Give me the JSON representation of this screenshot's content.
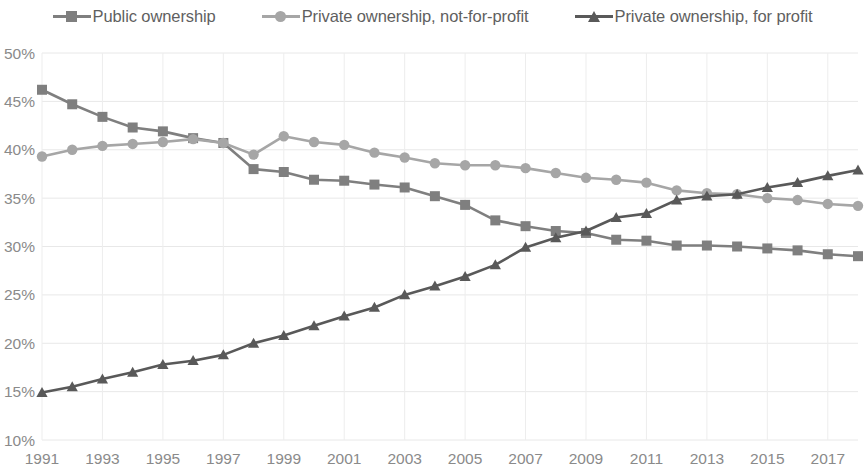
{
  "legend": {
    "position": "top-center",
    "items": [
      {
        "label": "Public ownership",
        "marker": "square-marker-icon",
        "color": "#7f7f7f"
      },
      {
        "label": "Private ownership, not-for-profit",
        "marker": "circle-marker-icon",
        "color": "#a6a6a6"
      },
      {
        "label": "Private ownership, for profit",
        "marker": "triangle-marker-icon",
        "color": "#595959"
      }
    ]
  },
  "axes": {
    "y_ticks": [
      "10%",
      "15%",
      "20%",
      "25%",
      "30%",
      "35%",
      "40%",
      "45%",
      "50%"
    ],
    "x_ticks": [
      "1991",
      "1993",
      "1995",
      "1997",
      "1999",
      "2001",
      "2003",
      "2005",
      "2007",
      "2009",
      "2011",
      "2013",
      "2015",
      "2017"
    ]
  },
  "chart_data": {
    "type": "line",
    "title": "",
    "subtitle": "",
    "xlabel": "",
    "ylabel": "",
    "xlim": [
      1991,
      2018
    ],
    "ylim": [
      10,
      50
    ],
    "y_tick_step": 5,
    "x_tick_step": 2,
    "grid": true,
    "value_suffix": "%",
    "legend_position": "top-center",
    "x": [
      1991,
      1992,
      1993,
      1994,
      1995,
      1996,
      1997,
      1998,
      1999,
      2000,
      2001,
      2002,
      2003,
      2004,
      2005,
      2006,
      2007,
      2008,
      2009,
      2010,
      2011,
      2012,
      2013,
      2014,
      2015,
      2016,
      2017,
      2018
    ],
    "series": [
      {
        "name": "Public ownership",
        "color": "#7f7f7f",
        "marker": "square",
        "values": [
          46.2,
          44.7,
          43.4,
          42.3,
          41.9,
          41.2,
          40.7,
          38.0,
          37.7,
          36.9,
          36.8,
          36.4,
          36.1,
          35.2,
          34.3,
          32.7,
          32.1,
          31.6,
          31.4,
          30.7,
          30.6,
          30.1,
          30.1,
          30.0,
          29.8,
          29.6,
          29.2,
          29.0
        ]
      },
      {
        "name": "Private ownership, not-for-profit",
        "color": "#a6a6a6",
        "marker": "circle",
        "values": [
          39.3,
          40.0,
          40.4,
          40.6,
          40.8,
          41.1,
          40.7,
          39.5,
          41.4,
          40.8,
          40.5,
          39.7,
          39.2,
          38.6,
          38.4,
          38.4,
          38.1,
          37.6,
          37.1,
          36.9,
          36.6,
          35.8,
          35.5,
          35.4,
          35.0,
          34.8,
          34.4,
          34.2
        ]
      },
      {
        "name": "Private ownership, for profit",
        "color": "#595959",
        "marker": "triangle",
        "values": [
          14.9,
          15.5,
          16.3,
          17.0,
          17.8,
          18.2,
          18.8,
          20.0,
          20.8,
          21.8,
          22.8,
          23.7,
          25.0,
          25.9,
          26.9,
          28.1,
          29.9,
          30.9,
          31.6,
          33.0,
          33.4,
          34.8,
          35.2,
          35.4,
          36.1,
          36.6,
          37.3,
          37.9
        ]
      }
    ]
  }
}
